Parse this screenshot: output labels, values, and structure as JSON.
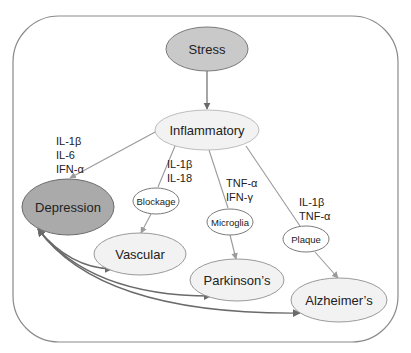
{
  "diagram": {
    "colors": {
      "frame": "#8a8a8a",
      "edge_gray": "#9a9a9a",
      "edge_dark": "#6a6a6a",
      "stress_fill": "#c9c9c9",
      "depression_fill": "#aaaaaa",
      "light_fill": "#f2f2f2",
      "white_fill": "#ffffff",
      "text": "#222222"
    },
    "nodes": {
      "stress": {
        "label": "Stress"
      },
      "inflammatory": {
        "label": "Inflammatory"
      },
      "depression": {
        "label": "Depression"
      },
      "blockage": {
        "label": "Blockage"
      },
      "microglia": {
        "label": "Microglia"
      },
      "plaque": {
        "label": "Plaque"
      },
      "vascular": {
        "label": "Vascular"
      },
      "parkinsons": {
        "label": "Parkinson’s"
      },
      "alzheimers": {
        "label": "Alzheimer’s"
      }
    },
    "edge_labels": {
      "to_depression": [
        "IL-1β",
        "IL-6",
        "IFN-α"
      ],
      "to_blockage": [
        "IL-1β",
        "IL-18"
      ],
      "to_microglia": [
        "TNF-α",
        "IFN-γ"
      ],
      "to_plaque": [
        "IL-1β",
        "TNF-α"
      ]
    },
    "edges": [
      {
        "from": "Stress",
        "to": "Inflammatory"
      },
      {
        "from": "Inflammatory",
        "to": "Depression"
      },
      {
        "from": "Inflammatory",
        "to": "Blockage"
      },
      {
        "from": "Inflammatory",
        "to": "Microglia"
      },
      {
        "from": "Inflammatory",
        "to": "Plaque"
      },
      {
        "from": "Blockage",
        "to": "Vascular"
      },
      {
        "from": "Microglia",
        "to": "Parkinson’s"
      },
      {
        "from": "Plaque",
        "to": "Alzheimer’s"
      },
      {
        "from": "Depression",
        "to": "Vascular",
        "bidirectional": true
      },
      {
        "from": "Depression",
        "to": "Parkinson’s",
        "bidirectional": true
      },
      {
        "from": "Depression",
        "to": "Alzheimer’s",
        "bidirectional": true
      }
    ]
  }
}
